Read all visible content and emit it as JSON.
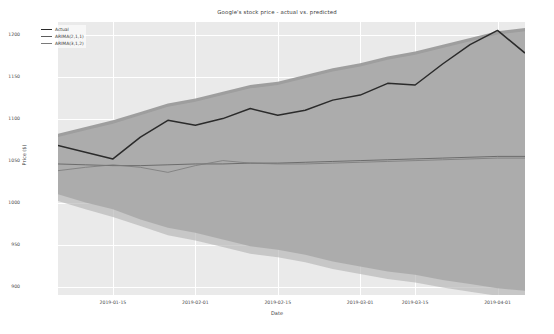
{
  "chart_data": {
    "type": "line",
    "title": "Google's stock price - actual vs. predicted",
    "xlabel": "Date",
    "ylabel": "Price ($)",
    "grid": true,
    "legend_position": "upper left",
    "ylim": [
      890,
      1215
    ],
    "yticks": [
      900,
      950,
      1000,
      1050,
      1100,
      1150,
      1200
    ],
    "ytick_labels": [
      "900",
      "950",
      "1000",
      "1050",
      "1100",
      "1150",
      "1200"
    ],
    "xticks": [
      "2019-01-15",
      "2019-02-01",
      "2019-02-15",
      "2019-03-01",
      "2019-03-15",
      "2019-04-01"
    ],
    "x": [
      "2019-01-07",
      "2019-01-11",
      "2019-01-15",
      "2019-01-22",
      "2019-01-28",
      "2019-02-01",
      "2019-02-07",
      "2019-02-13",
      "2019-02-15",
      "2019-02-22",
      "2019-02-28",
      "2019-03-05",
      "2019-03-11",
      "2019-03-15",
      "2019-03-21",
      "2019-03-26",
      "2019-04-01",
      "2019-04-04"
    ],
    "series": [
      {
        "name": "Actual",
        "color": "#2b2b2b",
        "values": [
          1068,
          1060,
          1052,
          1078,
          1098,
          1092,
          1100,
          1112,
          1104,
          1110,
          1122,
          1128,
          1142,
          1140,
          1165,
          1188,
          1205,
          1178
        ]
      },
      {
        "name": "ARIMA(2,1,1)",
        "color": "#5c5c5c",
        "values": [
          1046,
          1045,
          1044,
          1044,
          1045,
          1046,
          1046,
          1047,
          1047,
          1048,
          1049,
          1050,
          1051,
          1052,
          1053,
          1054,
          1055,
          1055
        ]
      },
      {
        "name": "ARIMA(3,1,2)",
        "color": "#7a7a7a",
        "values": [
          1038,
          1042,
          1045,
          1042,
          1036,
          1044,
          1050,
          1047,
          1046,
          1046,
          1047,
          1048,
          1049,
          1050,
          1051,
          1052,
          1053,
          1053
        ]
      }
    ],
    "confidence_bands": [
      {
        "name": "ARIMA(2,1,1) interval",
        "color": "#9a9a9a",
        "upper": [
          1082,
          1090,
          1098,
          1108,
          1118,
          1124,
          1132,
          1140,
          1144,
          1152,
          1160,
          1166,
          1174,
          1180,
          1188,
          1196,
          1204,
          1208
        ],
        "lower": [
          1010,
          1000,
          992,
          980,
          970,
          964,
          956,
          948,
          944,
          938,
          930,
          924,
          918,
          914,
          908,
          903,
          898,
          895
        ]
      },
      {
        "name": "ARIMA(3,1,2) interval",
        "color": "#b4b4b4",
        "upper": [
          1078,
          1086,
          1094,
          1104,
          1114,
          1120,
          1128,
          1136,
          1140,
          1148,
          1156,
          1162,
          1170,
          1176,
          1184,
          1192,
          1200,
          1204
        ],
        "lower": [
          1002,
          992,
          983,
          972,
          961,
          955,
          947,
          939,
          935,
          929,
          921,
          915,
          909,
          905,
          899,
          894,
          889,
          886
        ]
      }
    ]
  },
  "legend": {
    "items": [
      {
        "label": "Actual"
      },
      {
        "label": "ARIMA(2,1,1)"
      },
      {
        "label": "ARIMA(3,1,2)"
      }
    ]
  },
  "colors": {
    "plot_background": "#eaeaea",
    "figure_background": "#ffffff",
    "gridline": "#ffffff",
    "text": "#3d3d3d"
  }
}
